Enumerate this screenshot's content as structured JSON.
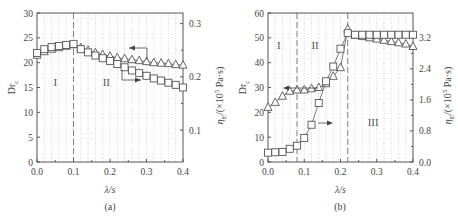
{
  "chart_data": [
    {
      "id": "a",
      "type": "line",
      "caption": "(a)",
      "xlabel": "λ/s",
      "ylabel": "Dr_c",
      "ylabel_right": "η_E/(×10^5 Pa·s)",
      "xlim": [
        0.0,
        0.4
      ],
      "ylim": [
        0,
        30
      ],
      "ylim_right": [
        0.04,
        0.32
      ],
      "xticks": [
        "0.0",
        "0.1",
        "0.2",
        "0.3",
        "0.4"
      ],
      "yticks": [
        "0",
        "5",
        "10",
        "15",
        "20",
        "25",
        "30"
      ],
      "yticks_right": [
        "0.1",
        "0.2",
        "0.3"
      ],
      "vline": 0.1,
      "regions": [
        "I",
        "II"
      ],
      "grid": "vertical dotted",
      "x": [
        0.0,
        0.02,
        0.04,
        0.06,
        0.08,
        0.1,
        0.12,
        0.14,
        0.16,
        0.18,
        0.2,
        0.22,
        0.24,
        0.26,
        0.28,
        0.3,
        0.32,
        0.34,
        0.36,
        0.38,
        0.4
      ],
      "series": [
        {
          "name": "Dr_c",
          "marker": "triangle",
          "axis": "left",
          "arrow": "left",
          "values": [
            21.5,
            22.2,
            22.7,
            23.0,
            23.3,
            23.6,
            23.0,
            22.5,
            22.0,
            21.6,
            21.3,
            21.0,
            20.8,
            20.6,
            20.4,
            20.2,
            20.0,
            19.9,
            19.8,
            19.6,
            19.5
          ]
        },
        {
          "name": "η_E",
          "marker": "square",
          "axis": "right",
          "arrow": "right",
          "values": [
            0.245,
            0.252,
            0.256,
            0.258,
            0.26,
            0.262,
            0.252,
            0.246,
            0.24,
            0.235,
            0.23,
            0.224,
            0.218,
            0.212,
            0.207,
            0.202,
            0.197,
            0.193,
            0.189,
            0.185,
            0.18
          ]
        }
      ]
    },
    {
      "id": "b",
      "type": "line",
      "caption": "(b)",
      "xlabel": "λ/s",
      "ylabel": "Dr_c",
      "ylabel_right": "η_E/(×10^5 Pa·s)",
      "xlim": [
        0.0,
        0.4
      ],
      "ylim": [
        0,
        60
      ],
      "ylim_right": [
        0.0,
        3.84
      ],
      "xticks": [
        "0.0",
        "0.1",
        "0.2",
        "0.3",
        "0.4"
      ],
      "yticks": [
        "0",
        "10",
        "20",
        "30",
        "40",
        "50",
        "60"
      ],
      "yticks_right": [
        "0.0",
        "0.8",
        "1.6",
        "2.4",
        "3.2"
      ],
      "vlines": [
        0.08,
        0.22
      ],
      "regions": [
        "I",
        "II",
        "III"
      ],
      "grid": "vertical dotted",
      "x": [
        0.0,
        0.02,
        0.04,
        0.06,
        0.08,
        0.1,
        0.12,
        0.14,
        0.16,
        0.18,
        0.2,
        0.22,
        0.24,
        0.26,
        0.28,
        0.3,
        0.32,
        0.34,
        0.36,
        0.38,
        0.4
      ],
      "series": [
        {
          "name": "Dr_c",
          "marker": "triangle",
          "axis": "left",
          "arrow": "left",
          "values": [
            22.0,
            24.0,
            26.5,
            28.5,
            29.0,
            29.0,
            29.5,
            30.0,
            31.5,
            34.5,
            38.0,
            53.5,
            51.0,
            50.5,
            50.0,
            49.5,
            49.0,
            48.5,
            48.0,
            47.5,
            46.5
          ]
        },
        {
          "name": "η_E",
          "marker": "square",
          "axis": "right",
          "arrow": "right",
          "values": [
            0.24,
            0.25,
            0.26,
            0.34,
            0.42,
            0.62,
            0.96,
            1.52,
            2.08,
            2.46,
            2.92,
            3.32,
            3.28,
            3.28,
            3.28,
            3.28,
            3.28,
            3.28,
            3.28,
            3.28,
            3.28
          ]
        }
      ]
    }
  ],
  "labels": {
    "a_caption": "(a)",
    "b_caption": "(b)",
    "xlabel": "λ/s",
    "ylabel_left": "Dr",
    "ylabel_left_sub": "c",
    "ylabel_right": "η",
    "ylabel_right_sub": "E",
    "ylabel_right_unit": "/(×10",
    "ylabel_right_exp": "5",
    "ylabel_right_tail": " Pa·s)"
  },
  "colors": {
    "axis": "#555555",
    "series": "#555555",
    "grid": "#bbbbbb"
  }
}
